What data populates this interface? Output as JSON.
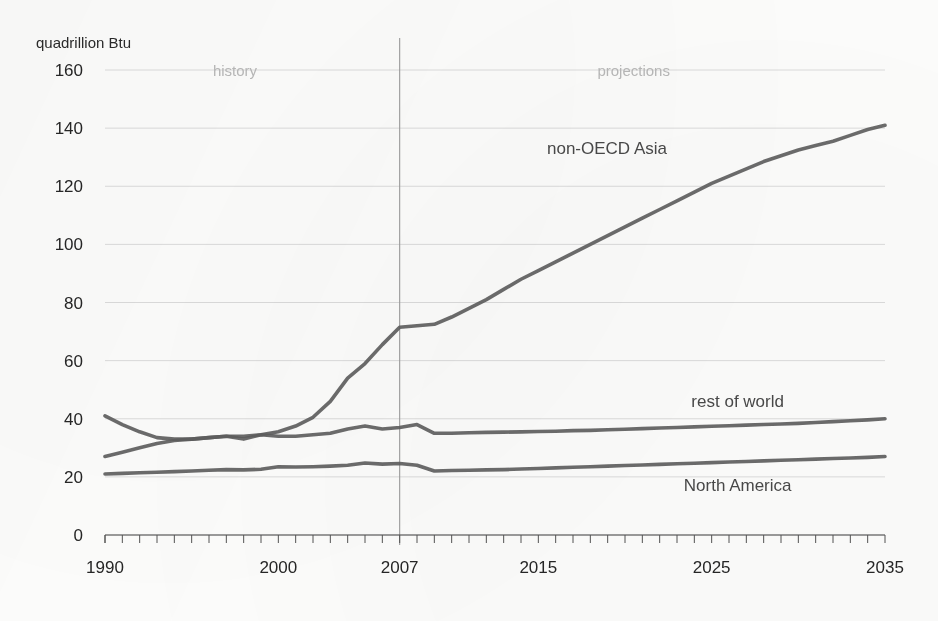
{
  "chart_data": {
    "type": "line",
    "title": "",
    "subtitle": "",
    "ylabel": "quadrillion Btu",
    "xlabel": "",
    "ylim": [
      0,
      160
    ],
    "xlim": [
      1990,
      2035
    ],
    "ytick_step": 20,
    "yticks": [
      0,
      20,
      40,
      60,
      80,
      100,
      120,
      140,
      160
    ],
    "xticks": [
      1990,
      2000,
      2007,
      2015,
      2025,
      2035
    ],
    "x_minor_tick_interval": 1,
    "grid": "horizontal",
    "legend_position": "inline-labels",
    "annotations": [
      {
        "name": "history-label",
        "text": "history",
        "x": 1997.5,
        "y": 158,
        "color": "#b9b9b9"
      },
      {
        "name": "projections-label",
        "text": "projections",
        "x": 2020.5,
        "y": 158,
        "color": "#b9b9b9"
      }
    ],
    "divider": {
      "x": 2007,
      "label_left": "history",
      "label_right": "projections",
      "color": "#9c9c9c"
    },
    "line_color": "#5d5d5d",
    "x": [
      1990,
      1991,
      1992,
      1993,
      1994,
      1995,
      1996,
      1997,
      1998,
      1999,
      2000,
      2001,
      2002,
      2003,
      2004,
      2005,
      2006,
      2007,
      2008,
      2009,
      2010,
      2011,
      2012,
      2013,
      2014,
      2015,
      2016,
      2017,
      2018,
      2019,
      2020,
      2021,
      2022,
      2023,
      2024,
      2025,
      2026,
      2027,
      2028,
      2029,
      2030,
      2031,
      2032,
      2033,
      2034,
      2035
    ],
    "series": [
      {
        "name": "non-OECD Asia",
        "label": "non-OECD Asia",
        "label_x": 2015.5,
        "label_y": 131,
        "color": "#5d5d5d",
        "values": [
          27.0,
          28.5,
          30.0,
          31.5,
          32.5,
          33.0,
          33.5,
          34.0,
          34.0,
          34.5,
          35.5,
          37.5,
          40.5,
          46.0,
          54.0,
          59.0,
          65.5,
          71.5,
          72.0,
          72.5,
          75.0,
          78.0,
          81.0,
          84.5,
          88.0,
          91.0,
          94.0,
          97.0,
          100.0,
          103.0,
          106.0,
          109.0,
          112.0,
          115.0,
          118.0,
          121.0,
          123.5,
          126.0,
          128.5,
          130.5,
          132.5,
          134.0,
          135.5,
          137.5,
          139.5,
          141.0
        ]
      },
      {
        "name": "rest of world",
        "label": "rest of world",
        "label_x": 2026.5,
        "label_y": 44,
        "color": "#5d5d5d",
        "values": [
          41.0,
          38.0,
          35.5,
          33.5,
          33.0,
          33.0,
          33.5,
          34.0,
          33.0,
          34.5,
          34.0,
          34.0,
          34.5,
          35.0,
          36.5,
          37.5,
          36.5,
          37.0,
          38.0,
          35.0,
          35.0,
          35.2,
          35.3,
          35.4,
          35.5,
          35.6,
          35.7,
          35.9,
          36.0,
          36.2,
          36.4,
          36.6,
          36.8,
          37.0,
          37.2,
          37.4,
          37.6,
          37.8,
          38.0,
          38.2,
          38.4,
          38.7,
          39.0,
          39.3,
          39.6,
          40.0
        ]
      },
      {
        "name": "North America",
        "label": "North America",
        "label_x": 2026.5,
        "label_y": 15,
        "color": "#5d5d5d",
        "values": [
          21.0,
          21.2,
          21.4,
          21.6,
          21.8,
          22.0,
          22.3,
          22.5,
          22.4,
          22.6,
          23.5,
          23.4,
          23.5,
          23.7,
          24.0,
          24.8,
          24.4,
          24.6,
          24.0,
          22.0,
          22.2,
          22.3,
          22.4,
          22.5,
          22.7,
          22.9,
          23.1,
          23.3,
          23.5,
          23.7,
          23.9,
          24.1,
          24.3,
          24.5,
          24.7,
          24.9,
          25.1,
          25.3,
          25.5,
          25.7,
          25.9,
          26.1,
          26.3,
          26.5,
          26.7,
          27.0
        ]
      }
    ]
  },
  "axis": {
    "y_title": "quadrillion Btu",
    "y_labels": [
      "160",
      "140",
      "120",
      "100",
      "80",
      "60",
      "40",
      "20",
      "0"
    ],
    "x_labels": [
      "1990",
      "2000",
      "2007",
      "2015",
      "2025",
      "2035"
    ]
  },
  "labels": {
    "history": "history",
    "projections": "projections",
    "non_oecd_asia": "non-OECD Asia",
    "rest_of_world": "rest of world",
    "north_america": "North America"
  }
}
